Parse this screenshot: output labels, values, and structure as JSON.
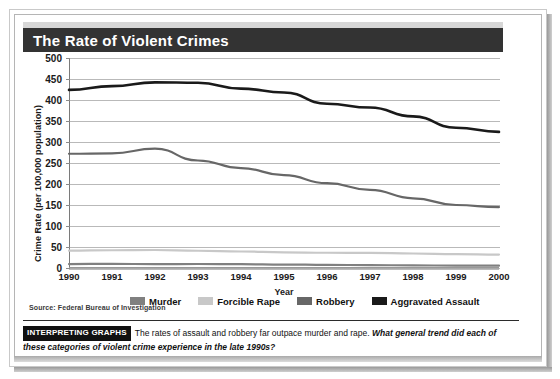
{
  "figure": {
    "title": "The Rate of Violent Crimes",
    "source": "Source: Federal Bureau of Investigation"
  },
  "caption": {
    "badge": "INTERPRETING GRAPHS",
    "lead": "The rates of assault and robbery far outpace murder and rape.",
    "question": "What general trend did each of these categories of violent crime experience in the late 1990s?"
  },
  "chart_data": {
    "type": "line",
    "title": "The Rate of Violent Crimes",
    "xlabel": "Year",
    "ylabel": "Crime Rate (per 100,000 population)",
    "x": [
      1990,
      1991,
      1992,
      1993,
      1994,
      1995,
      1996,
      1997,
      1998,
      1999,
      2000
    ],
    "categories": [
      "1990",
      "1991",
      "1992",
      "1993",
      "1994",
      "1995",
      "1996",
      "1997",
      "1998",
      "1999",
      "2000"
    ],
    "xlim": [
      1990,
      2000
    ],
    "ylim": [
      0,
      500
    ],
    "yticks": [
      0,
      50,
      100,
      150,
      200,
      250,
      300,
      350,
      400,
      450,
      500
    ],
    "grid": true,
    "legend_position": "bottom",
    "series": [
      {
        "name": "Murder",
        "color": "#808080",
        "values": [
          9.4,
          9.8,
          9.3,
          9.5,
          9.0,
          8.2,
          7.4,
          6.8,
          6.3,
          5.7,
          5.5
        ]
      },
      {
        "name": "Forcible Rape",
        "color": "#c8c8c8",
        "values": [
          41.2,
          42.3,
          42.8,
          41.1,
          39.3,
          37.1,
          36.3,
          35.9,
          34.5,
          32.8,
          32.0
        ]
      },
      {
        "name": "Robbery",
        "color": "#676767",
        "values": [
          272,
          273,
          284,
          256,
          238,
          221,
          202,
          186,
          166,
          150,
          145
        ]
      },
      {
        "name": "Aggravated Assault",
        "color": "#1a1a1a",
        "values": [
          424,
          433,
          442,
          441,
          427,
          418,
          391,
          382,
          361,
          334,
          324
        ]
      }
    ]
  },
  "legend": {
    "items": [
      {
        "label": "Murder",
        "color": "#808080"
      },
      {
        "label": "Forcible Rape",
        "color": "#c8c8c8"
      },
      {
        "label": "Robbery",
        "color": "#676767"
      },
      {
        "label": "Aggravated Assault",
        "color": "#1a1a1a"
      }
    ]
  }
}
